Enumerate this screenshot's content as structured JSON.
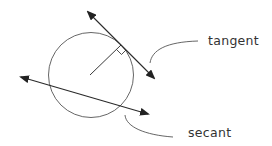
{
  "diagram": {
    "labels": {
      "tangent": "tangent",
      "secant": "secant"
    },
    "colors": {
      "stroke": "#3a3a3a",
      "arrow": "#222222",
      "text": "#333333",
      "background": "#ffffff"
    },
    "elements": [
      "circle",
      "radius-line",
      "right-angle-marker",
      "tangent-line",
      "secant-line",
      "tangent-leader-curve",
      "secant-leader-curve"
    ]
  }
}
